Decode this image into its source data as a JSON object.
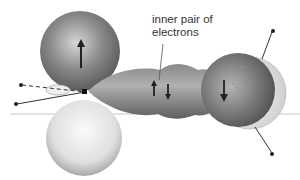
{
  "diagram": {
    "annotation": {
      "line1": "inner pair of",
      "line2": "electrons"
    },
    "lobes": [
      {
        "name": "upper-left-sphere",
        "spin": "up"
      },
      {
        "name": "lower-left-sphere",
        "spin": "none"
      },
      {
        "name": "central-elongated-bond-lobe",
        "spins": [
          "up",
          "down"
        ]
      },
      {
        "name": "right-sphere",
        "spin": "down"
      }
    ],
    "colors": {
      "dark_lobe": "#6e6e6e",
      "light_lobe": "#e8e8e8",
      "axis": "#cfcfcf",
      "line": "#333333"
    }
  }
}
